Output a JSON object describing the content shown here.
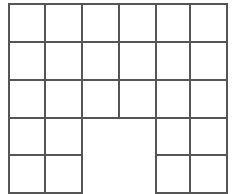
{
  "diagram": {
    "type": "grid-shape",
    "columns": 6,
    "rows": 5,
    "col_edges": [
      9,
      45,
      82,
      119,
      156,
      190,
      227
    ],
    "row_edges": [
      4,
      42,
      80,
      118,
      155,
      193
    ],
    "line_color": "#555555",
    "background": "#ffffff",
    "missing_cells": [
      [
        3,
        2
      ],
      [
        3,
        3
      ],
      [
        4,
        2
      ],
      [
        4,
        3
      ]
    ]
  }
}
